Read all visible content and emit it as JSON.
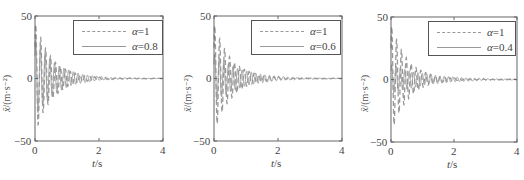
{
  "figure": {
    "panels": [
      {
        "id": "a08",
        "x_label_var": "t",
        "x_label_unit": "/s",
        "y_label_sym": "ẍ",
        "y_label_unit": "/(m·s⁻²)",
        "x_ticks": [
          "0",
          "2",
          "4"
        ],
        "y_ticks": [
          "50",
          "0",
          "−50"
        ],
        "legend": [
          {
            "style": "dashed",
            "alpha_sym": "α",
            "value": "=1"
          },
          {
            "style": "solid",
            "alpha_sym": "α",
            "value": "=0.8"
          }
        ]
      },
      {
        "id": "a06",
        "x_label_var": "t",
        "x_label_unit": "/s",
        "y_label_sym": "ẍ",
        "y_label_unit": "/(m·s⁻²)",
        "x_ticks": [
          "0",
          "2",
          "4"
        ],
        "y_ticks": [
          "50",
          "0",
          "−50"
        ],
        "legend": [
          {
            "style": "dashed",
            "alpha_sym": "α",
            "value": "=1"
          },
          {
            "style": "solid",
            "alpha_sym": "α",
            "value": "=0.6"
          }
        ]
      },
      {
        "id": "a04",
        "x_label_var": "t",
        "x_label_unit": "/s",
        "y_label_sym": "ẍ",
        "y_label_unit": "/(m·s⁻²)",
        "x_ticks": [
          "0",
          "2",
          "4"
        ],
        "y_ticks": [
          "50",
          "0",
          "−50"
        ],
        "legend": [
          {
            "style": "dashed",
            "alpha_sym": "α",
            "value": "=1"
          },
          {
            "style": "solid",
            "alpha_sym": "α",
            "value": "=0.4"
          }
        ]
      }
    ]
  },
  "chart_data": [
    {
      "type": "line",
      "title": "",
      "xlabel": "t/s",
      "ylabel": "ẍ/(m·s⁻²)",
      "xlim": [
        0,
        4
      ],
      "ylim": [
        -50,
        50
      ],
      "x_ticks": [
        0,
        2,
        4
      ],
      "y_ticks": [
        -50,
        0,
        50
      ],
      "grid": false,
      "legend_position": "upper right",
      "series": [
        {
          "name": "α=1",
          "style": "dashed",
          "color": "#999999",
          "peak_amplitude": 45,
          "decay_rate": 1.9,
          "frequency_hz": 6.5,
          "settle_time_s": 2.6
        },
        {
          "name": "α=0.8",
          "style": "solid",
          "color": "#999999",
          "peak_amplitude": 32,
          "decay_rate": 1.5,
          "frequency_hz": 6.8,
          "settle_time_s": 3.2
        }
      ]
    },
    {
      "type": "line",
      "title": "",
      "xlabel": "t/s",
      "ylabel": "ẍ/(m·s⁻²)",
      "xlim": [
        0,
        4
      ],
      "ylim": [
        -50,
        50
      ],
      "x_ticks": [
        0,
        2,
        4
      ],
      "y_ticks": [
        -50,
        0,
        50
      ],
      "grid": false,
      "legend_position": "upper right",
      "series": [
        {
          "name": "α=1",
          "style": "dashed",
          "color": "#999999",
          "peak_amplitude": 44,
          "decay_rate": 1.9,
          "frequency_hz": 6.5,
          "settle_time_s": 2.6
        },
        {
          "name": "α=0.6",
          "style": "solid",
          "color": "#999999",
          "peak_amplitude": 20,
          "decay_rate": 1.2,
          "frequency_hz": 7.0,
          "settle_time_s": 3.5
        }
      ]
    },
    {
      "type": "line",
      "title": "",
      "xlabel": "t/s",
      "ylabel": "ẍ/(m·s⁻²)",
      "xlim": [
        0,
        4
      ],
      "ylim": [
        -50,
        50
      ],
      "x_ticks": [
        0,
        2,
        4
      ],
      "y_ticks": [
        -50,
        0,
        50
      ],
      "grid": false,
      "legend_position": "upper right",
      "series": [
        {
          "name": "α=1",
          "style": "dashed",
          "color": "#999999",
          "peak_amplitude": 44,
          "decay_rate": 1.9,
          "frequency_hz": 6.5,
          "settle_time_s": 2.6
        },
        {
          "name": "α=0.4",
          "style": "solid",
          "color": "#999999",
          "peak_amplitude": 12,
          "decay_rate": 0.9,
          "frequency_hz": 7.2,
          "settle_time_s": 3.8
        }
      ]
    }
  ]
}
